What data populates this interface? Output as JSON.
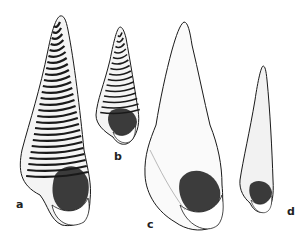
{
  "figure": {
    "type": "scientific illustration of gastropod shells",
    "labels": [
      "a",
      "b",
      "c",
      "d"
    ],
    "ink_color": "#1a1a1a",
    "paper_color": "#ffffff"
  }
}
